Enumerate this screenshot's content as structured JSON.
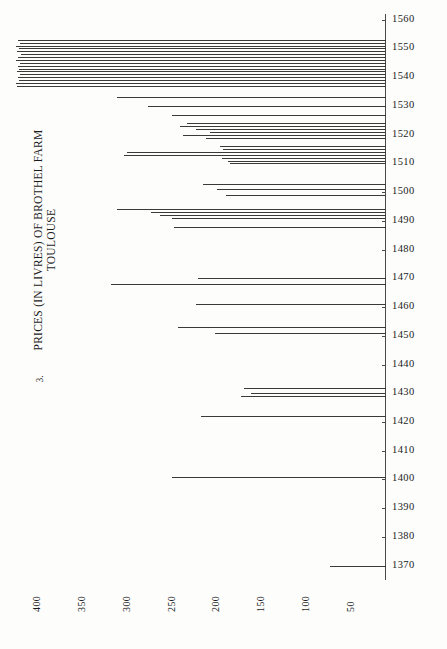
{
  "figure": {
    "number": "3.",
    "title_lines": [
      "PRICES (IN LIVRES) OF BROTHEL FARM",
      "TOULOUSE"
    ]
  },
  "chart_data": {
    "type": "bar",
    "orientation": "horizontal",
    "title": "PRICES (IN LIVRES) OF BROTHEL FARM TOULOUSE",
    "xlabel": "",
    "ylabel": "",
    "grid": false,
    "legend": null,
    "xlim": [
      430,
      0
    ],
    "x_axis_reversed": true,
    "ylim": [
      1365,
      1562
    ],
    "x_ticks": [
      400,
      350,
      300,
      250,
      200,
      150,
      100,
      50
    ],
    "y_ticks": [
      1560,
      1550,
      1540,
      1530,
      1520,
      1510,
      1500,
      1490,
      1480,
      1470,
      1460,
      1450,
      1440,
      1430,
      1420,
      1410,
      1400,
      1390,
      1380,
      1370
    ],
    "note": "Each horizontal line is one year's recorded price; bar extends leftward from the zero axis at right. Longer bar = higher price in livres.",
    "categories": [
      1553,
      1552,
      1551,
      1550,
      1549,
      1548,
      1547,
      1546,
      1545,
      1544,
      1543,
      1542,
      1541,
      1540,
      1539,
      1538,
      1537,
      1533,
      1530,
      1527,
      1524,
      1523,
      1522,
      1521,
      1520,
      1519,
      1516,
      1515,
      1514,
      1513,
      1512,
      1511,
      1510,
      1503,
      1501,
      1499,
      1494,
      1493,
      1492,
      1491,
      1488,
      1470,
      1468,
      1461,
      1453,
      1451,
      1432,
      1430,
      1429,
      1422,
      1401,
      1370
    ],
    "values": [
      410,
      408,
      412,
      409,
      411,
      407,
      410,
      412,
      408,
      410,
      409,
      411,
      408,
      410,
      409,
      412,
      411,
      300,
      265,
      238,
      222,
      230,
      212,
      196,
      226,
      200,
      185,
      182,
      288,
      292,
      183,
      176,
      174,
      204,
      188,
      178,
      300,
      262,
      252,
      238,
      236,
      210,
      306,
      212,
      232,
      190,
      158,
      150,
      162,
      206,
      238,
      62
    ],
    "series": [
      {
        "name": "Brothel farm price (livres)",
        "values": [
          410,
          408,
          412,
          409,
          411,
          407,
          410,
          412,
          408,
          410,
          409,
          411,
          408,
          410,
          409,
          412,
          411,
          300,
          265,
          238,
          222,
          230,
          212,
          196,
          226,
          200,
          185,
          182,
          288,
          292,
          183,
          176,
          174,
          204,
          188,
          178,
          300,
          262,
          252,
          238,
          236,
          210,
          306,
          212,
          232,
          190,
          158,
          150,
          162,
          206,
          238,
          62
        ]
      }
    ],
    "bars": [
      {
        "year": 1553,
        "value": 410
      },
      {
        "year": 1552,
        "value": 408
      },
      {
        "year": 1551,
        "value": 412
      },
      {
        "year": 1550,
        "value": 409
      },
      {
        "year": 1549,
        "value": 411
      },
      {
        "year": 1548,
        "value": 407
      },
      {
        "year": 1547,
        "value": 410
      },
      {
        "year": 1546,
        "value": 412
      },
      {
        "year": 1545,
        "value": 408
      },
      {
        "year": 1544,
        "value": 410
      },
      {
        "year": 1543,
        "value": 409
      },
      {
        "year": 1542,
        "value": 411
      },
      {
        "year": 1541,
        "value": 408
      },
      {
        "year": 1540,
        "value": 410
      },
      {
        "year": 1539,
        "value": 409
      },
      {
        "year": 1538,
        "value": 412
      },
      {
        "year": 1537,
        "value": 411
      },
      {
        "year": 1533,
        "value": 300
      },
      {
        "year": 1530,
        "value": 265
      },
      {
        "year": 1527,
        "value": 238
      },
      {
        "year": 1524,
        "value": 222
      },
      {
        "year": 1523,
        "value": 230
      },
      {
        "year": 1522,
        "value": 212
      },
      {
        "year": 1521,
        "value": 196
      },
      {
        "year": 1520,
        "value": 226
      },
      {
        "year": 1519,
        "value": 200
      },
      {
        "year": 1516,
        "value": 185
      },
      {
        "year": 1515,
        "value": 182
      },
      {
        "year": 1514,
        "value": 288
      },
      {
        "year": 1513,
        "value": 292
      },
      {
        "year": 1512,
        "value": 183
      },
      {
        "year": 1511,
        "value": 176
      },
      {
        "year": 1510,
        "value": 174
      },
      {
        "year": 1503,
        "value": 204
      },
      {
        "year": 1501,
        "value": 188
      },
      {
        "year": 1499,
        "value": 178
      },
      {
        "year": 1494,
        "value": 300
      },
      {
        "year": 1493,
        "value": 262
      },
      {
        "year": 1492,
        "value": 252
      },
      {
        "year": 1491,
        "value": 238
      },
      {
        "year": 1488,
        "value": 236
      },
      {
        "year": 1470,
        "value": 210
      },
      {
        "year": 1468,
        "value": 306
      },
      {
        "year": 1461,
        "value": 212
      },
      {
        "year": 1453,
        "value": 232
      },
      {
        "year": 1451,
        "value": 190
      },
      {
        "year": 1432,
        "value": 158
      },
      {
        "year": 1430,
        "value": 150
      },
      {
        "year": 1429,
        "value": 162
      },
      {
        "year": 1422,
        "value": 206
      },
      {
        "year": 1401,
        "value": 238
      },
      {
        "year": 1370,
        "value": 62
      }
    ]
  },
  "colors": {
    "ink": "#1b1b1b",
    "bar": "#3a3a3a",
    "axis": "#4a4a4a",
    "paper": "#fdfdfc"
  }
}
